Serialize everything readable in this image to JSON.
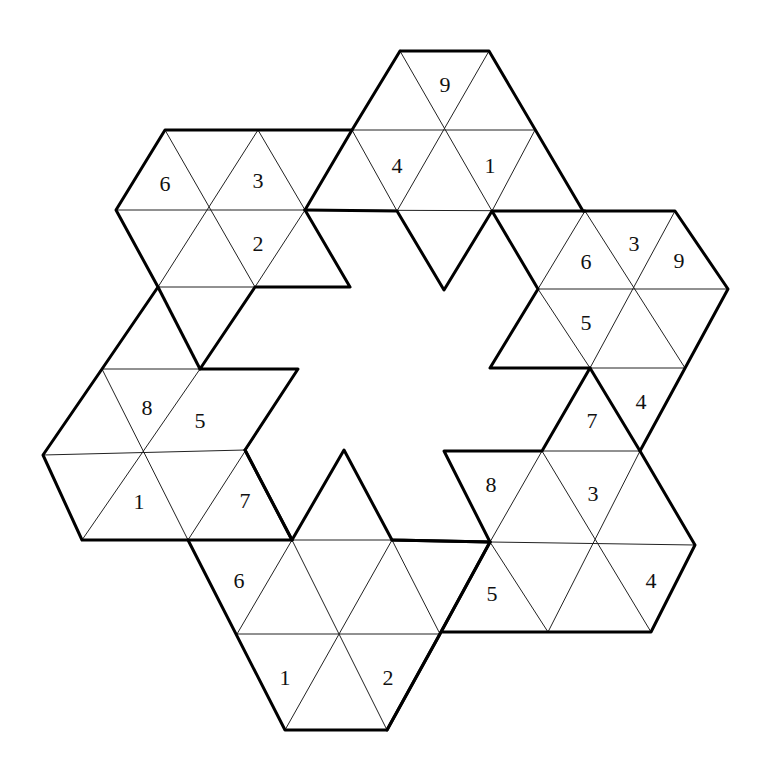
{
  "puzzle": {
    "type": "hexagram triangle number puzzle",
    "colors": {
      "background": "#ffffff",
      "grid_line": "#222222",
      "region_border": "#000000",
      "digit": "#111111"
    },
    "givens": [
      {
        "id": "g1",
        "value": "9",
        "x": 445,
        "y": 84
      },
      {
        "id": "g2",
        "value": "4",
        "x": 397,
        "y": 165
      },
      {
        "id": "g3",
        "value": "1",
        "x": 490,
        "y": 165
      },
      {
        "id": "g4",
        "value": "6",
        "x": 165,
        "y": 183
      },
      {
        "id": "g5",
        "value": "3",
        "x": 258,
        "y": 180
      },
      {
        "id": "g6",
        "value": "2",
        "x": 258,
        "y": 243
      },
      {
        "id": "g7",
        "value": "6",
        "x": 586,
        "y": 261
      },
      {
        "id": "g8",
        "value": "3",
        "x": 634,
        "y": 243
      },
      {
        "id": "g9",
        "value": "9",
        "x": 679,
        "y": 260
      },
      {
        "id": "g10",
        "value": "5",
        "x": 586,
        "y": 322
      },
      {
        "id": "g11",
        "value": "8",
        "x": 147,
        "y": 407
      },
      {
        "id": "g12",
        "value": "5",
        "x": 200,
        "y": 420
      },
      {
        "id": "g13",
        "value": "4",
        "x": 641,
        "y": 401
      },
      {
        "id": "g14",
        "value": "7",
        "x": 592,
        "y": 420
      },
      {
        "id": "g15",
        "value": "1",
        "x": 139,
        "y": 501
      },
      {
        "id": "g16",
        "value": "7",
        "x": 245,
        "y": 500
      },
      {
        "id": "g17",
        "value": "8",
        "x": 491,
        "y": 484
      },
      {
        "id": "g18",
        "value": "3",
        "x": 593,
        "y": 493
      },
      {
        "id": "g19",
        "value": "6",
        "x": 239,
        "y": 580
      },
      {
        "id": "g20",
        "value": "5",
        "x": 492,
        "y": 593
      },
      {
        "id": "g21",
        "value": "4",
        "x": 651,
        "y": 580
      },
      {
        "id": "g22",
        "value": "1",
        "x": 285,
        "y": 677
      },
      {
        "id": "g23",
        "value": "2",
        "x": 388,
        "y": 677
      }
    ]
  }
}
